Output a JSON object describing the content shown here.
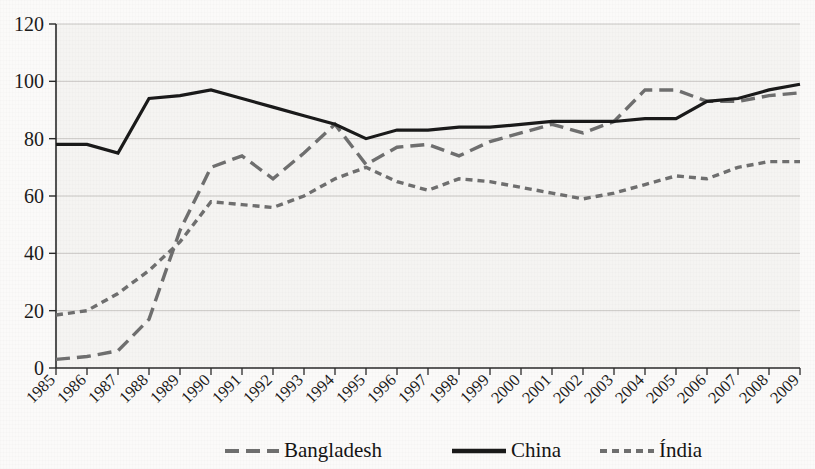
{
  "figure": {
    "clipped_top_text": "",
    "background_color": "#fbfaf9"
  },
  "chart_data": {
    "type": "line",
    "title": "",
    "xlabel": "",
    "ylabel": "",
    "ylim": [
      0,
      120
    ],
    "yticks": [
      0,
      20,
      40,
      60,
      80,
      100,
      120
    ],
    "grid": true,
    "legend_position": "bottom",
    "categories": [
      "1985",
      "1986",
      "1987",
      "1988",
      "1989",
      "1990",
      "1991",
      "1992",
      "1993",
      "1994",
      "1995",
      "1996",
      "1997",
      "1998",
      "1999",
      "2000",
      "2001",
      "2002",
      "2003",
      "2004",
      "2005",
      "2006",
      "2007",
      "2008",
      "2009"
    ],
    "series": [
      {
        "name": "Bangladesh",
        "color": "#6f6f6f",
        "style": "dashed",
        "values": [
          3,
          4,
          6,
          17,
          48,
          70,
          74,
          66,
          75,
          85,
          71,
          77,
          78,
          74,
          79,
          82,
          85,
          82,
          86,
          97,
          97,
          93,
          93,
          95,
          96
        ]
      },
      {
        "name": "China",
        "color": "#1a1a1a",
        "style": "solid",
        "values": [
          78,
          78,
          75,
          94,
          95,
          97,
          94,
          91,
          88,
          85,
          80,
          83,
          83,
          84,
          84,
          85,
          86,
          86,
          86,
          87,
          87,
          93,
          94,
          97,
          99
        ]
      },
      {
        "name": "Índia",
        "color": "#6f6f6f",
        "style": "dotted",
        "values": [
          18.5,
          20,
          26,
          34,
          44,
          58,
          57,
          56,
          60,
          66,
          70,
          65,
          62,
          66,
          65,
          63,
          61,
          59,
          61,
          64,
          67,
          66,
          70,
          72,
          72
        ]
      }
    ]
  },
  "legend": {
    "items": [
      {
        "label": "Bangladesh",
        "style": "dashed",
        "color": "#6f6f6f"
      },
      {
        "label": "China",
        "style": "solid",
        "color": "#1a1a1a"
      },
      {
        "label": "Índia",
        "style": "dotted",
        "color": "#6f6f6f"
      }
    ]
  }
}
